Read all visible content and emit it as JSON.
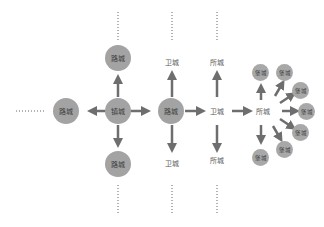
{
  "diagram": {
    "colors": {
      "node_fill": "#a3a3a3",
      "arrow": "#6e6e6e",
      "dotted_line": "#666666",
      "text": "#3a3a3a",
      "plain_text": "#5a5a5a"
    },
    "nodes": {
      "center": "镇城",
      "top": "路城",
      "left": "路城",
      "bottom": "路城",
      "right": "路城",
      "wei_top": "卫城",
      "wei_mid": "卫城",
      "wei_bottom": "卫城",
      "suo_top": "所城",
      "suo_mid": "所城",
      "suo_bottom": "所城",
      "bao": [
        "堡城",
        "堡城",
        "堡城",
        "堡城",
        "堡城",
        "堡城",
        "堡城"
      ]
    }
  }
}
